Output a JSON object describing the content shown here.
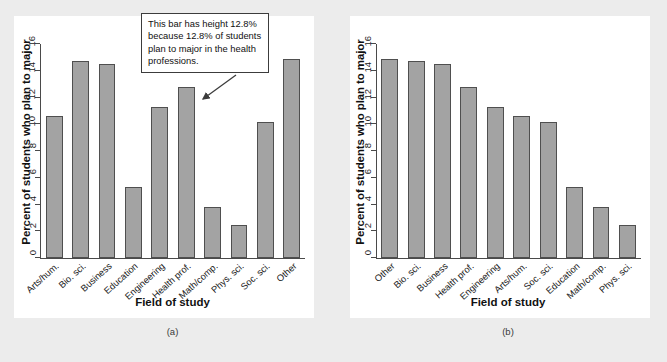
{
  "chart_data": [
    {
      "type": "bar",
      "panel_label": "(a)",
      "title": "",
      "xlabel": "Field of study",
      "ylabel": "Percent of students who plan to major",
      "ylim": [
        0,
        16
      ],
      "yticks": [
        0,
        2,
        4,
        6,
        8,
        10,
        12,
        14,
        16
      ],
      "grid": false,
      "legend": "none",
      "ordering": "alphabetical",
      "categories": [
        "Arts/hum.",
        "Bio. sci.",
        "Business",
        "Education",
        "Engineering",
        "Health prof.",
        "Math/comp.",
        "Phys. sci.",
        "Soc. sci.",
        "Other"
      ],
      "values": [
        10.6,
        14.7,
        14.5,
        5.3,
        11.3,
        12.8,
        3.8,
        2.5,
        10.2,
        14.9
      ],
      "annotations": [
        {
          "text": "This bar has height 12.8% because 12.8% of students plan to major in the health professions.",
          "points_to_category": "Health prof.",
          "points_to_value": 12.8
        }
      ]
    },
    {
      "type": "bar",
      "panel_label": "(b)",
      "title": "",
      "xlabel": "Field of study",
      "ylabel": "Percent of students who plan to major",
      "ylim": [
        0,
        16
      ],
      "yticks": [
        0,
        2,
        4,
        6,
        8,
        10,
        12,
        14,
        16
      ],
      "grid": false,
      "legend": "none",
      "ordering": "descending (Pareto)",
      "categories": [
        "Other",
        "Bio. sci.",
        "Business",
        "Health prof.",
        "Engineering",
        "Arts/hum.",
        "Soc. sci.",
        "Education",
        "Math/comp.",
        "Phys. sci."
      ],
      "values": [
        14.9,
        14.7,
        14.5,
        12.8,
        11.3,
        10.6,
        10.2,
        5.3,
        3.8,
        2.5
      ],
      "annotations": []
    }
  ],
  "style": {
    "bar_fill": "#a3a3a3",
    "bar_border": "#4f4f4f",
    "page_background": "#ececec",
    "plot_background": "#ffffff",
    "axis_color": "#4a4a4a",
    "text_color": "#111111"
  }
}
